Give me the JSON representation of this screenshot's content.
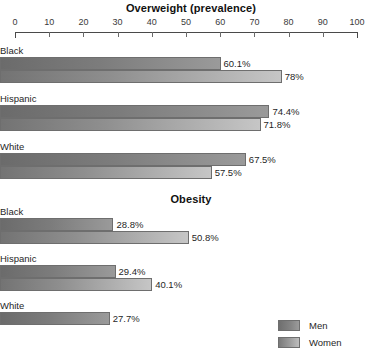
{
  "chart_data": [
    {
      "type": "bar",
      "title": "Overweight (prevalence)",
      "orientation": "horizontal",
      "categories": [
        "Black",
        "Hispanic",
        "White"
      ],
      "series": [
        {
          "name": "Men",
          "values": [
            60.1,
            74.4,
            67.5
          ],
          "labels": [
            "60.1%",
            "74.4%",
            "67.5%"
          ]
        },
        {
          "name": "Women",
          "values": [
            78.0,
            71.8,
            57.5
          ],
          "labels": [
            "78%",
            "71.8%",
            "57.5%"
          ]
        }
      ],
      "xlabel": "",
      "ylabel": "",
      "xlim": [
        0,
        100
      ],
      "xticks": [
        0,
        10,
        20,
        30,
        40,
        50,
        60,
        70,
        80,
        90,
        100
      ],
      "xtick_labels": [
        "0",
        "10",
        "20",
        "30",
        "40",
        "50",
        "60",
        "70",
        "80",
        "90",
        "100"
      ],
      "grid": false,
      "axis_visible": true
    },
    {
      "type": "bar",
      "title": "Obesity",
      "orientation": "horizontal",
      "categories": [
        "Black",
        "Hispanic",
        "White"
      ],
      "series": [
        {
          "name": "Men",
          "values": [
            28.8,
            29.4,
            27.7
          ],
          "labels": [
            "28.8%",
            "29.4%",
            "27.7%"
          ]
        },
        {
          "name": "Women",
          "values": [
            50.8,
            40.1,
            null
          ],
          "labels": [
            "50.8%",
            "40.1%",
            ""
          ]
        }
      ],
      "xlabel": "",
      "ylabel": "",
      "xlim": [
        0,
        100
      ],
      "grid": false,
      "axis_visible": false,
      "note": "shares x-scale with the chart above; the White / Women bar is cropped off the bottom of the image"
    }
  ],
  "legend": {
    "position": "bottom-right",
    "items": [
      {
        "label": "Men",
        "color": "#7c7c7c"
      },
      {
        "label": "Women",
        "color": "#a8a8a8"
      }
    ]
  },
  "colors": {
    "men_bar": "#7c7c7c",
    "women_bar": "#a8a8a8",
    "bar_border": "#6e6e6e",
    "axis": "#4a4a4a",
    "text": "#1f1f1f",
    "background": "#ffffff"
  }
}
